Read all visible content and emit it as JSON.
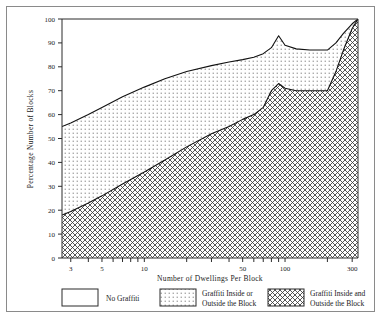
{
  "chart_data": {
    "type": "area",
    "title": "",
    "xlabel": "Number of Dwellings Per Block",
    "ylabel": "Percentage Number of Blocks",
    "xscale": "log",
    "xlim": [
      2.6,
      330
    ],
    "ylim": [
      0,
      100
    ],
    "xticks": [
      3,
      5,
      10,
      50,
      100,
      300
    ],
    "xtick_labels": [
      "3",
      "5",
      "10",
      "50",
      "100",
      "300"
    ],
    "yticks": [
      0,
      10,
      20,
      30,
      40,
      50,
      60,
      70,
      80,
      90,
      100
    ],
    "ytick_labels": [
      "0",
      "10",
      "20",
      "30",
      "40",
      "50",
      "60",
      "70",
      "80",
      "90",
      "100"
    ],
    "grid": false,
    "legend_position": "below",
    "stacking": "cumulative-from-bottom",
    "series": [
      {
        "name": "Graffiti Inside and Outside the Block",
        "fill": "cross-hatch",
        "boundary": "lower-curve",
        "x": [
          2.6,
          3,
          4,
          5,
          7,
          10,
          14,
          20,
          30,
          40,
          50,
          60,
          70,
          80,
          90,
          100,
          120,
          150,
          180,
          200,
          230,
          260,
          300,
          330
        ],
        "y": [
          18,
          19.5,
          23,
          26,
          31,
          36,
          41,
          46.5,
          52,
          55,
          58,
          60,
          63,
          70,
          73,
          71,
          70,
          70,
          70,
          70,
          78,
          87,
          96,
          100
        ]
      },
      {
        "name": "Graffiti Inside or Outside the Block",
        "fill": "dots",
        "boundary": "upper-curve",
        "x": [
          2.6,
          3,
          4,
          5,
          7,
          10,
          14,
          20,
          30,
          40,
          50,
          60,
          70,
          80,
          90,
          100,
          120,
          150,
          180,
          200,
          230,
          260,
          300,
          330
        ],
        "y": [
          55,
          56.5,
          60,
          63,
          67.5,
          71.5,
          75,
          78,
          80.5,
          82,
          83,
          84,
          85.5,
          88,
          93,
          89,
          87.5,
          87,
          87,
          87,
          90,
          94,
          98,
          100
        ]
      },
      {
        "name": "No Graffiti",
        "fill": "white",
        "boundary": "above-upper-curve"
      }
    ]
  },
  "legend": {
    "items": [
      {
        "label_line1": "No Graffiti",
        "label_line2": "",
        "pattern": "white"
      },
      {
        "label_line1": "Graffiti Inside or",
        "label_line2": "Outside the Block",
        "pattern": "dots"
      },
      {
        "label_line1": "Graffiti Inside and",
        "label_line2": "Outside the Block",
        "pattern": "cross-hatch"
      }
    ]
  },
  "colors": {
    "axis": "#2b2b2b",
    "curve": "#111111",
    "frame": "#8a8a8a",
    "background": "#ffffff",
    "hatch": "#3a3a3a",
    "dots": "#555555"
  }
}
